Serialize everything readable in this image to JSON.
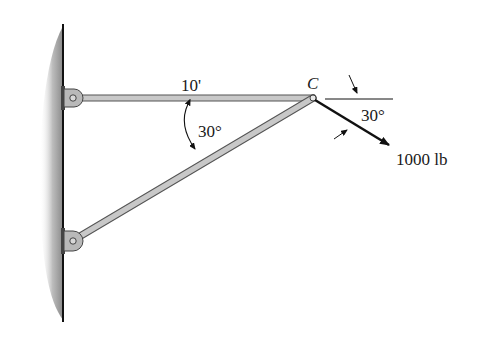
{
  "figure": {
    "labels": {
      "length": "10'",
      "strut_angle": "30°",
      "joint": "C",
      "force_angle": "30°",
      "force": "1000 lb"
    },
    "colors": {
      "member_fill": "#c8c8c8",
      "member_stroke": "#555555",
      "wall_shade": "#9a9a9a",
      "ink": "#111111"
    }
  }
}
